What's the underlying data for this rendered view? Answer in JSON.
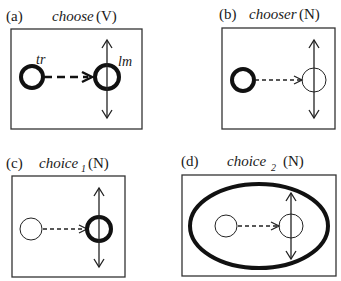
{
  "figure": {
    "panels": [
      {
        "id": "a",
        "letter": "(a)",
        "word": "choose",
        "subscript": "",
        "pos": "(V)",
        "trajector_label": "tr",
        "landmark_label": "lm",
        "profiled": [
          "trajector",
          "landmark",
          "relation"
        ]
      },
      {
        "id": "b",
        "letter": "(b)",
        "word": "chooser",
        "subscript": "",
        "pos": "(N)",
        "profiled": [
          "trajector"
        ]
      },
      {
        "id": "c",
        "letter": "(c)",
        "word": "choice",
        "subscript": "1",
        "pos": "(N)",
        "profiled": [
          "landmark"
        ]
      },
      {
        "id": "d",
        "letter": "(d)",
        "word": "choice",
        "subscript": "2",
        "pos": "(N)",
        "profiled": [
          "whole-event"
        ]
      }
    ],
    "colors": {
      "ink": "#1a1a1a",
      "background": "#ffffff"
    }
  }
}
